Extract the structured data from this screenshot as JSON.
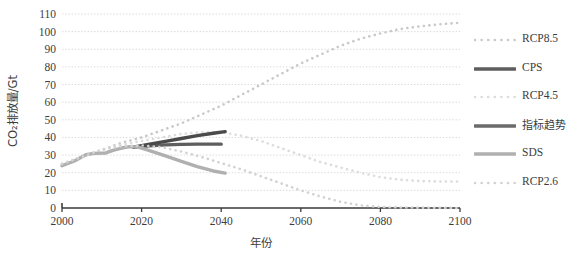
{
  "chart_data": {
    "type": "line",
    "title": "",
    "xlabel": "年份",
    "ylabel": "CO₂排放量/Gt",
    "xlim": [
      2000,
      2100
    ],
    "ylim": [
      0,
      110
    ],
    "ytick_step": 10,
    "xtick_step": 20,
    "grid": true,
    "grid_style": "dotted",
    "legend_position": "right",
    "xticks": [
      "2000",
      "2020",
      "2040",
      "2060",
      "2080",
      "2100"
    ],
    "yticks": [
      "0",
      "10",
      "20",
      "30",
      "40",
      "50",
      "60",
      "70",
      "80",
      "90",
      "100",
      "110"
    ],
    "series": [
      {
        "name": "RCP8.5",
        "style": "dotted",
        "color": "#c9c9c9",
        "width": 2.6,
        "x": [
          2000,
          2005,
          2010,
          2015,
          2020,
          2025,
          2030,
          2035,
          2040,
          2045,
          2050,
          2055,
          2060,
          2065,
          2070,
          2075,
          2080,
          2085,
          2090,
          2095,
          2100
        ],
        "y": [
          25,
          29,
          33,
          37,
          40,
          44,
          48,
          53,
          58,
          64,
          70,
          76,
          82,
          87,
          92,
          96,
          99,
          101.5,
          103,
          104.2,
          105
        ]
      },
      {
        "name": "CPS",
        "style": "solid",
        "color": "#5e5e5e",
        "width": 3.4,
        "x": [
          2018,
          2022,
          2026,
          2030,
          2034,
          2038,
          2040
        ],
        "y": [
          34.5,
          35.3,
          35.8,
          36.1,
          36.2,
          36.2,
          36.2
        ]
      },
      {
        "name": "RCP4.5",
        "style": "dotted",
        "color": "#dcdcdc",
        "width": 2.6,
        "x": [
          2000,
          2005,
          2010,
          2015,
          2020,
          2025,
          2030,
          2035,
          2040,
          2045,
          2050,
          2055,
          2060,
          2065,
          2070,
          2075,
          2080,
          2085,
          2090,
          2095,
          2100
        ],
        "y": [
          25,
          29,
          33,
          36,
          38,
          40,
          42,
          43,
          43,
          41,
          38,
          34,
          30,
          26,
          23,
          20,
          17.5,
          16,
          15.3,
          15,
          15
        ]
      },
      {
        "name": "指标趋势",
        "style": "solid",
        "color": "#4a4a4a",
        "width": 3.4,
        "x": [
          2018,
          2022,
          2026,
          2030,
          2034,
          2038,
          2041
        ],
        "y": [
          34.5,
          36.2,
          37.8,
          39.4,
          41,
          42.4,
          43.3
        ]
      },
      {
        "name": "SDS",
        "style": "solid",
        "color": "#b0b0b0",
        "width": 3.4,
        "x": [
          2000,
          2003,
          2006,
          2008,
          2011,
          2013,
          2015,
          2017,
          2019,
          2022,
          2026,
          2030,
          2034,
          2038,
          2041
        ],
        "y": [
          24,
          26.5,
          30.2,
          31,
          31.2,
          32.8,
          34,
          34.8,
          34.6,
          32.5,
          29.5,
          26.5,
          23.5,
          21,
          19.8
        ]
      },
      {
        "name": "RCP2.6",
        "style": "dotted",
        "color": "#d2d2d2",
        "width": 2.6,
        "x": [
          2000,
          2005,
          2010,
          2015,
          2020,
          2025,
          2030,
          2035,
          2040,
          2045,
          2050,
          2055,
          2060,
          2065,
          2070,
          2075,
          2080,
          2085,
          2090,
          2095,
          2100
        ],
        "y": [
          25,
          29,
          33,
          35,
          35.5,
          34.5,
          32,
          29,
          25.5,
          22,
          18,
          14,
          10,
          6.5,
          3.5,
          1.5,
          0.6,
          0.3,
          0.2,
          0.1,
          0
        ]
      }
    ]
  },
  "legend": {
    "items": [
      {
        "label": "RCP8.5",
        "style": "dotted",
        "color": "#c9c9c9"
      },
      {
        "label": "CPS",
        "style": "solid",
        "color": "#5e5e5e"
      },
      {
        "label": "RCP4.5",
        "style": "dotted",
        "color": "#dcdcdc"
      },
      {
        "label": "指标趋势",
        "style": "solid",
        "color": "#6b6b6b"
      },
      {
        "label": "SDS",
        "style": "solid",
        "color": "#b0b0b0"
      },
      {
        "label": "RCP2.6",
        "style": "dotted",
        "color": "#d2d2d2"
      }
    ]
  },
  "colors": {
    "axis": "#3d3d3d",
    "grid": "#d9d9d9",
    "background": "#ffffff"
  }
}
